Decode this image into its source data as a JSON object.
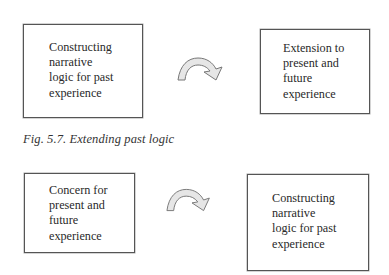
{
  "figure_top": {
    "left_box": {
      "lines": [
        "Constructing",
        "narrative",
        "logic for past",
        "experience"
      ]
    },
    "arrow": {
      "icon": "curved-arrow-right-icon",
      "fill": "#e6e6e6",
      "stroke": "#777777"
    },
    "right_box": {
      "lines": [
        "Extension to",
        "present and",
        "future",
        "experience"
      ]
    },
    "caption": "Fig. 5.7.  Extending past logic"
  },
  "figure_bottom": {
    "left_box": {
      "lines": [
        "Concern for",
        "present and",
        "future",
        "experience"
      ]
    },
    "arrow": {
      "icon": "curved-arrow-right-icon",
      "fill": "#e6e6e6",
      "stroke": "#777777"
    },
    "right_box": {
      "lines": [
        "Constructing",
        "narrative",
        "logic for past",
        "experience"
      ]
    }
  }
}
